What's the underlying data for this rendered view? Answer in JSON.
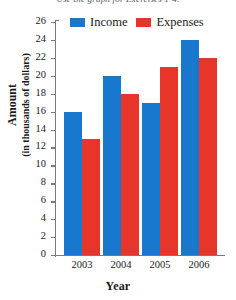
{
  "page": {
    "cut_off_caption": "Use the graph for Exercises 1-4."
  },
  "chart_data": {
    "type": "bar",
    "title": "",
    "xlabel": "Year",
    "ylabel_line1": "Amount",
    "ylabel_line2": "(in thousands of dollars)",
    "categories": [
      "2003",
      "2004",
      "2005",
      "2006"
    ],
    "series": [
      {
        "name": "Income",
        "color": "#1878ce",
        "values": [
          16,
          20,
          17,
          24
        ]
      },
      {
        "name": "Expenses",
        "color": "#e8352a",
        "values": [
          13,
          18,
          21,
          22
        ]
      }
    ],
    "ylim": [
      0,
      26
    ],
    "yticks": [
      26,
      24,
      22,
      20,
      18,
      16,
      14,
      12,
      10,
      8,
      6,
      4,
      2,
      0
    ],
    "grid": false,
    "legend_position": "top"
  }
}
